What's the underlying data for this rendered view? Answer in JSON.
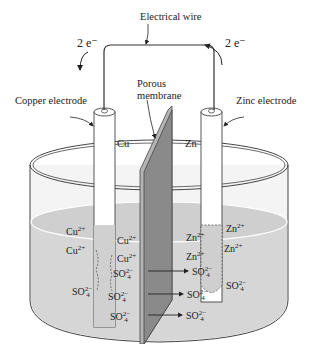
{
  "diagram": {
    "labels": {
      "wire": "Electrical wire",
      "electrons_left": "2 e⁻",
      "electrons_right": "2 e⁻",
      "copper_electrode": "Copper electrode",
      "zinc_electrode": "Zinc electrode",
      "membrane_line1": "Porous",
      "membrane_line2": "membrane",
      "cu": "Cu",
      "zn": "Zn"
    },
    "ions_left": [
      {
        "base": "Cu",
        "charge": "2+",
        "x": 68,
        "y": 270
      },
      {
        "base": "Cu",
        "charge": "2+",
        "x": 68,
        "y": 290
      },
      {
        "base": "Cu",
        "charge": "2+",
        "x": 117,
        "y": 276
      },
      {
        "base": "Cu",
        "charge": "2+",
        "x": 117,
        "y": 294
      },
      {
        "base": "SO",
        "sub": "4",
        "charge": "2−",
        "x": 113,
        "y": 311
      },
      {
        "base": "SO",
        "sub": "4",
        "charge": "2−",
        "x": 72,
        "y": 287
      },
      {
        "base": "SO",
        "sub": "4",
        "charge": "2−",
        "x": 108,
        "y": 328
      },
      {
        "base": "SO",
        "sub": "4",
        "charge": "2−",
        "x": 110,
        "y": 347
      }
    ],
    "ions_right": [
      {
        "base": "Zn",
        "charge": "2+",
        "x": 186,
        "y": 266
      },
      {
        "base": "Zn",
        "charge": "2+",
        "x": 186,
        "y": 290
      },
      {
        "base": "Zn",
        "charge": "2+",
        "x": 225,
        "y": 259
      },
      {
        "base": "Zn",
        "charge": "2+",
        "x": 223,
        "y": 282
      },
      {
        "base": "SO",
        "sub": "4",
        "charge": "2−",
        "x": 193,
        "y": 307
      },
      {
        "base": "SO",
        "sub": "4",
        "charge": "2−",
        "x": 226,
        "y": 318
      },
      {
        "base": "SO",
        "sub": "4",
        "charge": "2−",
        "x": 187,
        "y": 328
      },
      {
        "base": "SO",
        "sub": "4",
        "charge": "2−",
        "x": 186,
        "y": 348
      }
    ],
    "colors": {
      "solution": "#d6d6d6",
      "membrane_front": "#8a8a8a",
      "membrane_side": "#b5b5b5",
      "line": "#333333"
    }
  }
}
